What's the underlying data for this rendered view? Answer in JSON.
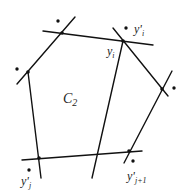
{
  "diagram": {
    "type": "polygon-with-lines",
    "region_label": "C",
    "region_subscript": "2",
    "lines": [
      {
        "name": "top-line",
        "x1": 43,
        "y1": 31,
        "x2": 153,
        "y2": 45
      },
      {
        "name": "upper-left-line",
        "x1": 17,
        "y1": 84,
        "x2": 75,
        "y2": 17
      },
      {
        "name": "left-line",
        "x1": 28,
        "y1": 72,
        "x2": 41,
        "y2": 178
      },
      {
        "name": "middle-line",
        "x1": 123,
        "y1": 41,
        "x2": 92,
        "y2": 178
      },
      {
        "name": "upper-right-line",
        "x1": 113,
        "y1": 28,
        "x2": 168,
        "y2": 96
      },
      {
        "name": "right-line",
        "x1": 172,
        "y1": 71,
        "x2": 124,
        "y2": 163
      },
      {
        "name": "bottom-line",
        "x1": 22,
        "y1": 160,
        "x2": 142,
        "y2": 151
      }
    ],
    "vertices": [
      {
        "name": "vertex-top-left",
        "x": 62,
        "y": 33
      },
      {
        "name": "vertex-left",
        "x": 28,
        "y": 72
      },
      {
        "name": "vertex-yi",
        "x": 123,
        "y": 41
      },
      {
        "name": "vertex-right",
        "x": 162,
        "y": 89
      },
      {
        "name": "vertex-bottom-right",
        "x": 129,
        "y": 151
      },
      {
        "name": "vertex-bottom-left",
        "x": 39,
        "y": 158
      }
    ],
    "points": [
      {
        "name": "dot-top-left",
        "x": 58,
        "y": 21
      },
      {
        "name": "dot-left",
        "x": 17,
        "y": 69
      },
      {
        "name": "dot-yi-prime",
        "x": 126,
        "y": 28
      },
      {
        "name": "dot-right",
        "x": 174,
        "y": 88
      },
      {
        "name": "dot-yj-prime",
        "x": 29,
        "y": 170
      },
      {
        "name": "dot-yj1-prime",
        "x": 133,
        "y": 161
      }
    ],
    "labels": {
      "yi_prime": {
        "base": "y",
        "prime": "'",
        "sub": "i",
        "x": 134,
        "y": 33
      },
      "yi": {
        "base": "y",
        "sub": "i",
        "x": 107,
        "y": 55
      },
      "c2": {
        "base": "C",
        "sub": "2",
        "x": 63,
        "y": 103
      },
      "yj_prime": {
        "base": "y",
        "prime": "'",
        "sub": "j",
        "x": 21,
        "y": 185
      },
      "yj1_prime": {
        "base": "y",
        "prime": "'",
        "sub": "j+1",
        "x": 127,
        "y": 180
      }
    }
  }
}
